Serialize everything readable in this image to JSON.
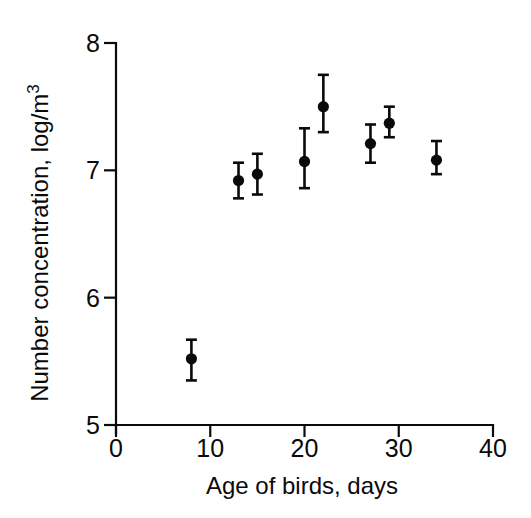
{
  "figure": {
    "background": "#ffffff",
    "ink_color": "#0a0a0a"
  },
  "chart_data": {
    "type": "scatter",
    "title": "",
    "xlabel": "Age of birds, days",
    "ylabel": "Number concentration, log/m",
    "ylabel_superscript": "3",
    "xlim": [
      0,
      40
    ],
    "ylim": [
      5,
      8
    ],
    "x_ticks": [
      0,
      10,
      20,
      30,
      40
    ],
    "y_ticks": [
      5,
      6,
      7,
      8
    ],
    "grid": false,
    "legend_position": "none",
    "marker": "filled-circle",
    "series": [
      {
        "name": "number-concentration-vs-age",
        "color": "#0a0a0a",
        "points": [
          {
            "x": 8,
            "y": 5.52,
            "err_up": 0.15,
            "err_down": 0.17
          },
          {
            "x": 13,
            "y": 6.92,
            "err_up": 0.14,
            "err_down": 0.14
          },
          {
            "x": 15,
            "y": 6.97,
            "err_up": 0.16,
            "err_down": 0.16
          },
          {
            "x": 20,
            "y": 7.07,
            "err_up": 0.26,
            "err_down": 0.21
          },
          {
            "x": 22,
            "y": 7.5,
            "err_up": 0.25,
            "err_down": 0.2
          },
          {
            "x": 27,
            "y": 7.21,
            "err_up": 0.15,
            "err_down": 0.15
          },
          {
            "x": 29,
            "y": 7.37,
            "err_up": 0.13,
            "err_down": 0.11
          },
          {
            "x": 34,
            "y": 7.08,
            "err_up": 0.15,
            "err_down": 0.11
          }
        ]
      }
    ]
  }
}
